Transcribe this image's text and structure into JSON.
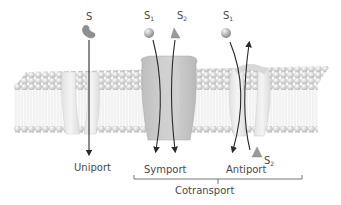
{
  "diagram": {
    "title": "",
    "colors": {
      "background": "#ffffff",
      "membrane_head": "#d8d8d8",
      "membrane_tail": "#eeeeee",
      "protein_light": "#e6e6e6",
      "protein_dark": "#c4c4c4",
      "arrow": "#2a2a2a",
      "text": "#4a4a4a"
    },
    "solutes": [
      {
        "id": "S",
        "label": "S",
        "subscript": "",
        "shape": "bean",
        "position": "top"
      },
      {
        "id": "S1_symport",
        "label": "S",
        "subscript": "1",
        "shape": "sphere",
        "position": "top"
      },
      {
        "id": "S2_symport",
        "label": "S",
        "subscript": "2",
        "shape": "pyramid",
        "position": "top"
      },
      {
        "id": "S1_antiport",
        "label": "S",
        "subscript": "1",
        "shape": "sphere",
        "position": "top"
      },
      {
        "id": "S2_antiport",
        "label": "S",
        "subscript": "2",
        "shape": "pyramid",
        "position": "bottom"
      }
    ],
    "transporters": [
      {
        "name": "Uniport",
        "arrows": [
          "down"
        ]
      },
      {
        "name": "Symport",
        "arrows": [
          "down",
          "down"
        ]
      },
      {
        "name": "Antiport",
        "arrows": [
          "down",
          "up"
        ]
      }
    ],
    "group_label": "Cotransport",
    "group_members": [
      "Symport",
      "Antiport"
    ]
  },
  "labels": {
    "s": "S",
    "s1": "S",
    "s1_sub": "1",
    "s2": "S",
    "s2_sub": "2",
    "uniport": "Uniport",
    "symport": "Symport",
    "antiport": "Antiport",
    "cotransport": "Cotransport"
  }
}
